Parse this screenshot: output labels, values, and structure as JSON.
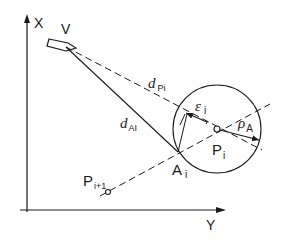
{
  "diagram": {
    "axes": {
      "x_label": "X",
      "y_label": "Y"
    },
    "labels": {
      "vessel": "V",
      "d_pi": {
        "base": "d",
        "sub": "Pi"
      },
      "d_ai": {
        "base": "d",
        "sub": "AI"
      },
      "epsilon": {
        "base": "ε",
        "sub": "i"
      },
      "rho": {
        "base": "ρ",
        "sub": "A"
      },
      "p_i": {
        "base": "P",
        "sub": "i"
      },
      "a_i": {
        "base": "A",
        "sub": "i"
      },
      "p_i1": {
        "base": "P",
        "sub": "i+1"
      }
    },
    "colors": {
      "stroke": "#1a1a1a",
      "background": "#ffffff"
    }
  }
}
